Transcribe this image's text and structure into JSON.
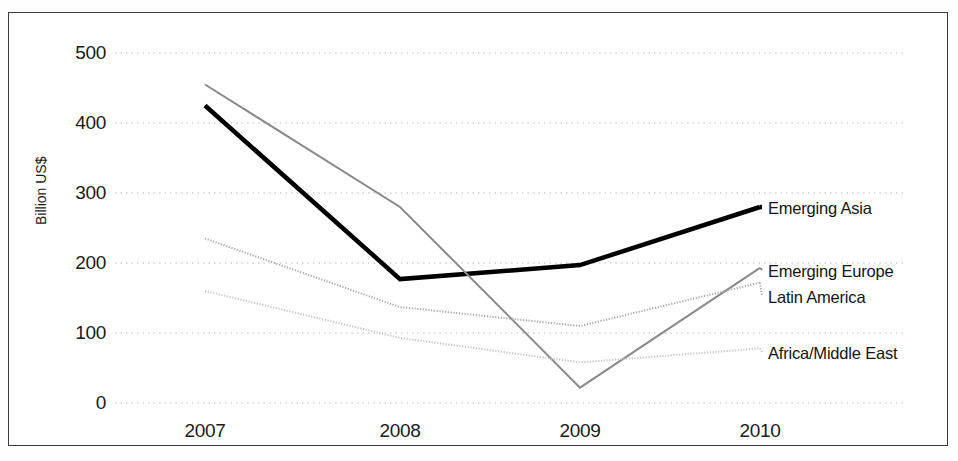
{
  "chart_data": {
    "type": "line",
    "title": "",
    "subtitle": "",
    "xlabel": "",
    "ylabel": "Billion US$",
    "categories": [
      "2007",
      "2008",
      "2009",
      "2010"
    ],
    "x": [
      2007,
      2008,
      2009,
      2010
    ],
    "xlim": [
      2007,
      2010
    ],
    "ylim": [
      0,
      500
    ],
    "yticks": [
      0,
      100,
      200,
      300,
      400,
      500
    ],
    "ytick_labels": [
      "0",
      "100",
      "200",
      "300",
      "400",
      "500"
    ],
    "xtick_labels": [
      "2007",
      "2008",
      "2009",
      "2010"
    ],
    "grid": "horizontal-dotted",
    "legend_position": "right-inline-labels",
    "series": [
      {
        "name": "Emerging Asia",
        "values": [
          425,
          177,
          197,
          280
        ],
        "color": "#000000",
        "width": 4.5,
        "style": "solid",
        "label_y": 207
      },
      {
        "name": "Emerging Europe",
        "values": [
          455,
          280,
          22,
          193
        ],
        "color": "#8a8a8a",
        "width": 2.0,
        "style": "solid",
        "label_y": 270
      },
      {
        "name": "Latin America",
        "values": [
          235,
          137,
          110,
          172
        ],
        "color": "#a8a8a8",
        "width": 2.0,
        "style": "dotted",
        "label_y": 296
      },
      {
        "name": "Africa/Middle East",
        "values": [
          160,
          93,
          58,
          78
        ],
        "color": "#c4c4c4",
        "width": 2.0,
        "style": "dotted",
        "label_y": 352
      }
    ]
  },
  "axis": {
    "y_labels": [
      "500",
      "400",
      "300",
      "200",
      "100",
      "0"
    ],
    "x_labels": [
      "2007",
      "2008",
      "2009",
      "2010"
    ],
    "y_title": "Billion US$"
  },
  "series_labels": {
    "emerging_asia": "Emerging Asia",
    "emerging_europe": "Emerging Europe",
    "latin_america": "Latin America",
    "africa_middle_east": "Africa/Middle East"
  }
}
